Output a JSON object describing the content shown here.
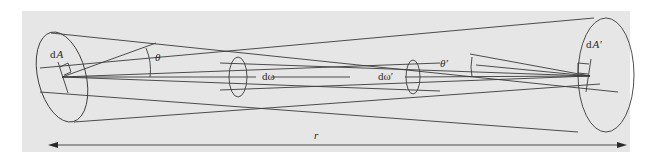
{
  "diagram": {
    "type": "radiative-transfer-geometry",
    "background_color": "#e6e6e6",
    "line_color": "#3a3a3a",
    "labels": {
      "area_left_d": "d",
      "area_left_var": "A",
      "area_right_d": "d",
      "area_right_var": "A′",
      "angle_left": "θ",
      "angle_right": "θ′",
      "solid_angle_left": "dω",
      "solid_angle_right": "dω′",
      "distance": "r"
    }
  }
}
